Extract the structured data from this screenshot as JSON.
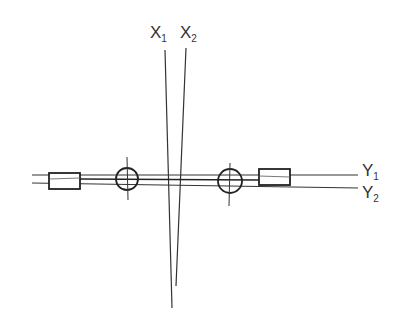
{
  "diagram": {
    "labels": {
      "x1": {
        "main": "X",
        "sub": "1"
      },
      "x2": {
        "main": "X",
        "sub": "2"
      },
      "y1": {
        "main": "Y",
        "sub": "1"
      },
      "y2": {
        "main": "Y",
        "sub": "2"
      }
    },
    "colors": {
      "stroke": "#222222",
      "background": "#ffffff"
    }
  }
}
